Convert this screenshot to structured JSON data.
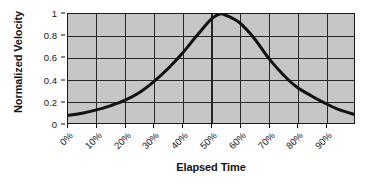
{
  "chart_data": {
    "type": "line",
    "title": "",
    "xlabel": "Elapsed Time",
    "ylabel": "Normalized Velocity",
    "xlim": [
      0,
      100
    ],
    "ylim": [
      0,
      1
    ],
    "grid": true,
    "legend": null,
    "legend_position": "none",
    "x_tick_labels": [
      "0%",
      "10%",
      "20%",
      "30%",
      "40%",
      "50%",
      "60%",
      "70%",
      "80%",
      "90%"
    ],
    "x_tick_values": [
      0,
      10,
      20,
      30,
      40,
      50,
      60,
      70,
      80,
      90
    ],
    "y_tick_labels": [
      "0",
      "0.2",
      "0.4",
      "0.6",
      "0.8",
      "1"
    ],
    "y_tick_values": [
      0,
      0.2,
      0.4,
      0.6,
      0.8,
      1
    ],
    "series": [
      {
        "name": "Normalized Velocity",
        "color": "#111111",
        "line_width": 3,
        "x": [
          0,
          5,
          10,
          15,
          20,
          25,
          30,
          35,
          40,
          45,
          50,
          53,
          55,
          60,
          65,
          70,
          75,
          80,
          85,
          90,
          95,
          100
        ],
        "values": [
          0.07,
          0.09,
          0.12,
          0.16,
          0.21,
          0.28,
          0.38,
          0.5,
          0.64,
          0.8,
          0.95,
          1.0,
          0.99,
          0.92,
          0.78,
          0.6,
          0.45,
          0.33,
          0.25,
          0.18,
          0.12,
          0.08
        ]
      }
    ],
    "style": {
      "plot_background": "#c6c6c6",
      "grid_color": "#262626",
      "axis_color": "#1a1a1a",
      "text_color": "#161616",
      "figure_background": "#ffffff"
    }
  }
}
